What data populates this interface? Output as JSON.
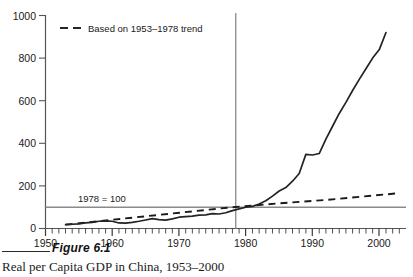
{
  "figure": {
    "number_label": "Figure 6.1",
    "title": "Real per Capita GDP in China, 1953–2000"
  },
  "annotations": {
    "baseline_note": "1978 = 100"
  },
  "colors": {
    "axis": "#555555",
    "data_line": "#232323",
    "trend_line": "#1a1a1a",
    "reference_line": "#8a8a8a",
    "vertical_marker": "#8a8a8a",
    "text": "#1a1a1a",
    "background": "#ffffff"
  },
  "chart_data": {
    "type": "line",
    "title": "Real per Capita GDP in China, 1953–2000",
    "xlabel": "",
    "ylabel": "",
    "xlim": [
      1950,
      2004
    ],
    "ylim": [
      0,
      1000
    ],
    "grid": false,
    "legend_position": "top-left",
    "xticks": [
      1950,
      1960,
      1970,
      1980,
      1990,
      2000
    ],
    "xtick_labels": [
      "1950",
      "1960",
      "1970",
      "1980",
      "1990",
      "2000"
    ],
    "minor_xtick_interval": 1,
    "yticks": [
      0,
      200,
      400,
      600,
      800,
      1000
    ],
    "ytick_labels": [
      "0",
      "200",
      "400",
      "600",
      "800",
      "1000"
    ],
    "reference_lines": [
      {
        "name": "index-100-line",
        "orientation": "horizontal",
        "value": 100,
        "label": "1978 = 100"
      },
      {
        "name": "year-1978-line",
        "orientation": "vertical",
        "value": 1978.5,
        "label": ""
      }
    ],
    "series": [
      {
        "name": "Real per capita GDP index (actual)",
        "style": "solid",
        "legend_shown": false,
        "x": [
          1953,
          1954,
          1955,
          1956,
          1957,
          1958,
          1959,
          1960,
          1961,
          1962,
          1963,
          1964,
          1965,
          1966,
          1967,
          1968,
          1969,
          1970,
          1971,
          1972,
          1973,
          1974,
          1975,
          1976,
          1977,
          1978,
          1979,
          1980,
          1981,
          1982,
          1983,
          1984,
          1985,
          1986,
          1987,
          1988,
          1989,
          1990,
          1991,
          1992,
          1993,
          1994,
          1995,
          1996,
          1997,
          1998,
          1999,
          2000
        ],
        "values": [
          19,
          21,
          23,
          26,
          28,
          33,
          34,
          33,
          27,
          26,
          29,
          34,
          39,
          43,
          40,
          38,
          42,
          49,
          52,
          54,
          58,
          59,
          63,
          61,
          66,
          74,
          80,
          86,
          90,
          97,
          108,
          124,
          139,
          150,
          168,
          188,
          192,
          193,
          208,
          234,
          263,
          294,
          325,
          357,
          388,
          418,
          452,
          500
        ],
        "note": "Index values (1978 = 100) rescaled to the plotted curve reaching about 920 by 2000"
      },
      {
        "name": "Based on 1953–1978 trend",
        "style": "dashed",
        "legend_shown": true,
        "legend_label": "Based on 1953–1978 trend",
        "x": [
          1953,
          1958,
          1963,
          1968,
          1973,
          1978,
          1983,
          1988,
          1993,
          1998,
          2003
        ],
        "values": [
          18,
          28,
          38,
          50,
          64,
          82,
          95,
          110,
          128,
          148,
          166
        ],
        "note": "Extrapolation of the pre-reform 1953–1978 growth trend"
      }
    ],
    "plotted_points": {
      "actual": [
        [
          1953,
          18
        ],
        [
          1954,
          20
        ],
        [
          1955,
          22
        ],
        [
          1956,
          26
        ],
        [
          1957,
          29
        ],
        [
          1958,
          34
        ],
        [
          1959,
          36
        ],
        [
          1960,
          34
        ],
        [
          1961,
          26
        ],
        [
          1962,
          25
        ],
        [
          1963,
          29
        ],
        [
          1964,
          34
        ],
        [
          1965,
          40
        ],
        [
          1966,
          46
        ],
        [
          1967,
          42
        ],
        [
          1968,
          39
        ],
        [
          1969,
          45
        ],
        [
          1970,
          53
        ],
        [
          1971,
          56
        ],
        [
          1972,
          58
        ],
        [
          1973,
          63
        ],
        [
          1974,
          64
        ],
        [
          1975,
          70
        ],
        [
          1976,
          68
        ],
        [
          1977,
          74
        ],
        [
          1978,
          84
        ],
        [
          1979,
          92
        ],
        [
          1980,
          100
        ],
        [
          1981,
          104
        ],
        [
          1982,
          115
        ],
        [
          1983,
          130
        ],
        [
          1984,
          152
        ],
        [
          1985,
          176
        ],
        [
          1986,
          192
        ],
        [
          1987,
          222
        ],
        [
          1988,
          258
        ],
        [
          1989,
          348
        ],
        [
          1990,
          345
        ],
        [
          1991,
          352
        ],
        [
          1992,
          420
        ],
        [
          1993,
          480
        ],
        [
          1994,
          540
        ],
        [
          1995,
          592
        ],
        [
          1996,
          648
        ],
        [
          1997,
          700
        ],
        [
          1998,
          750
        ],
        [
          1999,
          800
        ],
        [
          2000,
          840
        ],
        [
          2001,
          920
        ]
      ],
      "trend": [
        [
          1953,
          18
        ],
        [
          1978,
          100
        ],
        [
          1985,
          118
        ],
        [
          1992,
          134
        ],
        [
          2003,
          166
        ]
      ]
    }
  }
}
